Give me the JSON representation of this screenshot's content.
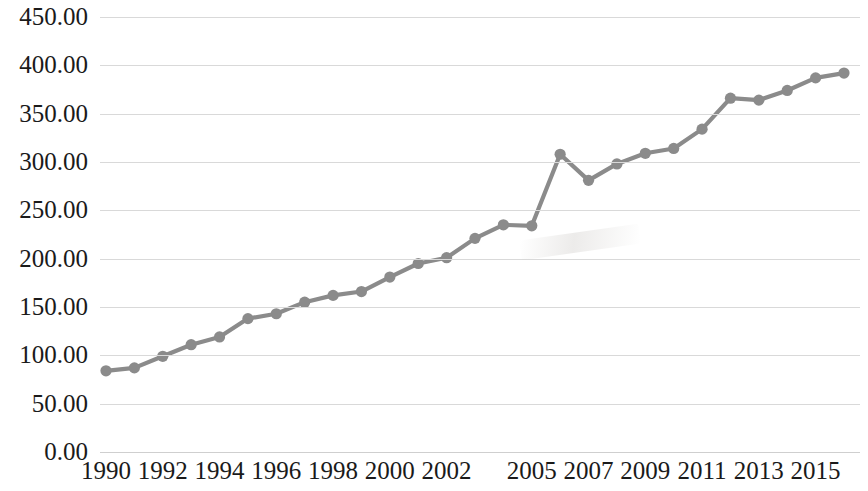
{
  "chart_data": {
    "type": "line",
    "title": "",
    "subtitle": "",
    "xlabel": "",
    "ylabel": "",
    "ylim": [
      0,
      450
    ],
    "y_ticks": [
      "0.00",
      "50.00",
      "100.00",
      "150.00",
      "200.00",
      "250.00",
      "300.00",
      "350.00",
      "400.00",
      "450.00"
    ],
    "y_tick_values": [
      0,
      50,
      100,
      150,
      200,
      250,
      300,
      350,
      400,
      450
    ],
    "x_tick_labels": [
      "1990",
      "1992",
      "1994",
      "1996",
      "1998",
      "2000",
      "2002",
      "2005",
      "2007",
      "2009",
      "2011",
      "2013",
      "2015"
    ],
    "x_tick_indices": [
      0,
      2,
      4,
      6,
      8,
      10,
      12,
      15,
      17,
      19,
      21,
      23,
      25
    ],
    "grid": true,
    "legend": "none",
    "marker": "circle",
    "line_color": "#8b8b8b",
    "marker_color": "#8b8b8b",
    "grid_color": "#d9d9d9",
    "categories": [
      "1990",
      "1991",
      "1992",
      "1993",
      "1994",
      "1995",
      "1996",
      "1997",
      "1998",
      "1999",
      "2000",
      "2001",
      "2002",
      "2003",
      "2004",
      "2005",
      "2006",
      "2007",
      "2008",
      "2009",
      "2010",
      "2011",
      "2012",
      "2013",
      "2014",
      "2015",
      "2016"
    ],
    "values": [
      84,
      87,
      99,
      111,
      119,
      138,
      143,
      155,
      162,
      166,
      181,
      195,
      201,
      221,
      235,
      234,
      308,
      281,
      298,
      309,
      314,
      334,
      366,
      364,
      374,
      387,
      392
    ],
    "series": [
      {
        "name": "series-1",
        "values": [
          84,
          87,
          99,
          111,
          119,
          138,
          143,
          155,
          162,
          166,
          181,
          195,
          201,
          221,
          235,
          234,
          308,
          281,
          298,
          309,
          314,
          334,
          366,
          364,
          374,
          387,
          392
        ]
      }
    ]
  }
}
